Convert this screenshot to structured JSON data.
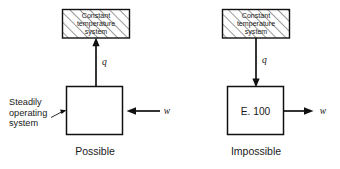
{
  "figure": {
    "background_color": "#ffffff",
    "line_color": "#111111"
  },
  "panels": [
    {
      "id": "left",
      "caption": "Possible",
      "reservoir": {
        "label_lines": [
          "Constant",
          "temperature",
          "system"
        ],
        "fill": "hatched"
      },
      "system": {
        "label": "",
        "annotation": {
          "lines": [
            "Steadily",
            "operating",
            "system"
          ],
          "has_leader": true
        }
      },
      "flows": [
        {
          "symbol": "q",
          "orientation": "vertical",
          "direction": "up",
          "meaning": "heat rejected from system to reservoir"
        },
        {
          "symbol": "w",
          "orientation": "horizontal",
          "direction": "left",
          "meaning": "work input into system"
        }
      ]
    },
    {
      "id": "right",
      "caption": "Impossible",
      "reservoir": {
        "label_lines": [
          "Constant",
          "temperature",
          "system"
        ],
        "fill": "hatched"
      },
      "system": {
        "label": "E. 100",
        "annotation": {
          "lines": [],
          "has_leader": false
        }
      },
      "flows": [
        {
          "symbol": "q",
          "orientation": "vertical",
          "direction": "down",
          "meaning": "heat absorbed by system from reservoir"
        },
        {
          "symbol": "w",
          "orientation": "horizontal",
          "direction": "right",
          "meaning": "work output from system"
        }
      ]
    }
  ]
}
